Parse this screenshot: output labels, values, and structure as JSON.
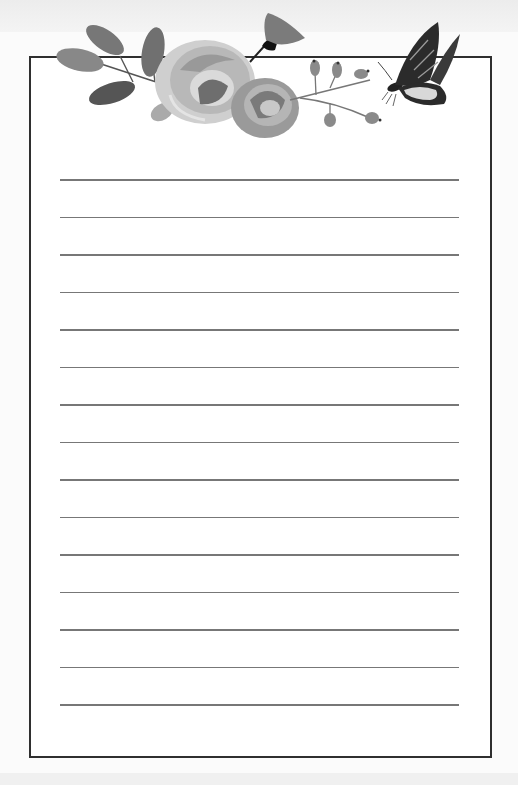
{
  "page": {
    "type": "lined-stationery",
    "line_count": 15,
    "line_start_y": 179,
    "line_spacing": 37.5,
    "colors": {
      "border": "#2f2f2f",
      "rule_line": "#777777",
      "paper": "#ffffff",
      "background": "#fbfbfb"
    }
  },
  "decorations": {
    "items": [
      {
        "name": "leaf-sprig",
        "label": ""
      },
      {
        "name": "rose-large",
        "label": ""
      },
      {
        "name": "rose-small",
        "label": ""
      },
      {
        "name": "bell-flower",
        "label": ""
      },
      {
        "name": "berry-sprig",
        "label": ""
      },
      {
        "name": "butterfly",
        "label": ""
      }
    ]
  }
}
